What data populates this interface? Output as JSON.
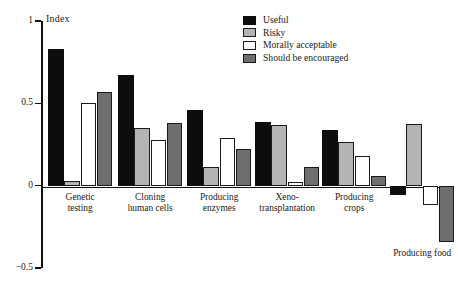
{
  "chart_data": {
    "type": "bar",
    "title": "",
    "xlabel": "",
    "ylabel": "Index",
    "ylim": [
      -0.5,
      1
    ],
    "yticks": [
      "1",
      "0.5",
      "0",
      "-0.5"
    ],
    "ytick_values": [
      1,
      0.5,
      0,
      -0.5
    ],
    "grid": false,
    "legend_position": "top-right",
    "categories": [
      "Genetic\ntesting",
      "Cloning\nhuman cells",
      "Producing\nenzymes",
      "Xeno-\ntransplantation",
      "Producing\ncrops",
      "Producing food"
    ],
    "series": [
      {
        "name": "Useful",
        "color": "#0d0d0d",
        "values": [
          0.83,
          0.67,
          0.46,
          0.385,
          0.34,
          -0.055
        ]
      },
      {
        "name": "Risky",
        "color": "#b4b4b4",
        "values": [
          0.03,
          0.35,
          0.115,
          0.37,
          0.265,
          0.375
        ]
      },
      {
        "name": "Morally acceptable",
        "color": "#ffffff",
        "values": [
          0.5,
          0.28,
          0.29,
          0.025,
          0.18,
          -0.12
        ]
      },
      {
        "name": "Should be encouraged",
        "color": "#6e6e6e",
        "values": [
          0.57,
          0.38,
          0.22,
          0.115,
          0.06,
          -0.34
        ]
      }
    ]
  },
  "legend": {
    "items": [
      {
        "label": "Useful"
      },
      {
        "label": "Risky"
      },
      {
        "label": "Morally acceptable"
      },
      {
        "label": "Should be encouraged"
      }
    ]
  },
  "axis": {
    "y_title": "Index"
  }
}
